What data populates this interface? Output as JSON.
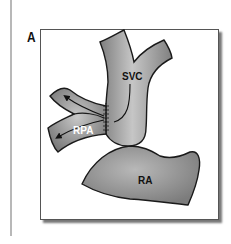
{
  "figure": {
    "panel_label": "A",
    "structures": {
      "svc": "SVC",
      "rpa": "RPA",
      "ra": "RA"
    },
    "colors": {
      "vessel_fill": "#8a8a8a",
      "vessel_highlight": "#c4c4c4",
      "outline": "#1a1a1a",
      "frame_border": "#555555",
      "rpa_label": "#ffffff",
      "label_dark": "#111111"
    }
  }
}
